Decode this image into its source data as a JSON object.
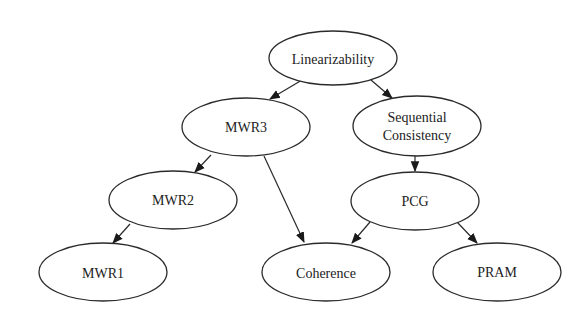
{
  "diagram": {
    "type": "directed-graph",
    "nodes": [
      {
        "id": "linearizability",
        "label": "Linearizability"
      },
      {
        "id": "mwr3",
        "label": "MWR3"
      },
      {
        "id": "seqcons",
        "label_line1": "Sequential",
        "label_line2": "Consistency"
      },
      {
        "id": "mwr2",
        "label": "MWR2"
      },
      {
        "id": "pcg",
        "label": "PCG"
      },
      {
        "id": "mwr1",
        "label": "MWR1"
      },
      {
        "id": "coherence",
        "label": "Coherence"
      },
      {
        "id": "pram",
        "label": "PRAM"
      }
    ],
    "edges": [
      {
        "from": "Linearizability",
        "to": "MWR3"
      },
      {
        "from": "Linearizability",
        "to": "Sequential Consistency"
      },
      {
        "from": "MWR3",
        "to": "MWR2"
      },
      {
        "from": "MWR3",
        "to": "Coherence"
      },
      {
        "from": "Sequential Consistency",
        "to": "PCG"
      },
      {
        "from": "MWR2",
        "to": "MWR1"
      },
      {
        "from": "PCG",
        "to": "Coherence"
      },
      {
        "from": "PCG",
        "to": "PRAM"
      }
    ]
  }
}
